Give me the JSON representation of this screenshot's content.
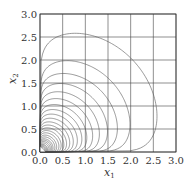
{
  "chart_data": {
    "type": "contour",
    "title": "",
    "xlabel": "x1",
    "ylabel": "x2",
    "xlim": [
      0,
      3.0
    ],
    "ylim": [
      0,
      3.0
    ],
    "grid": true,
    "xticks": [
      "0.0",
      "0.5",
      "1.0",
      "1.5",
      "2.0",
      "2.5",
      "3.0"
    ],
    "yticks": [
      "0.0",
      "0.5",
      "1.0",
      "1.5",
      "2.0",
      "2.5",
      "3.0"
    ],
    "xtick_values": [
      0,
      0.5,
      1.0,
      1.5,
      2.0,
      2.5,
      3.0
    ],
    "ytick_values": [
      0,
      0.5,
      1.0,
      1.5,
      2.0,
      2.5,
      3.0
    ],
    "contour_extents": [
      2.6,
      2.0,
      1.72,
      1.5,
      1.32,
      1.17,
      1.04,
      0.93,
      0.83,
      0.74,
      0.66,
      0.59,
      0.53,
      0.47,
      0.42,
      0.37,
      0.33,
      0.29,
      0.26,
      0.23,
      0.2,
      0.17,
      0.15,
      0.13,
      0.11,
      0.09,
      0.07,
      0.05
    ],
    "line_color": "#555555",
    "grid_color": "#444444"
  }
}
